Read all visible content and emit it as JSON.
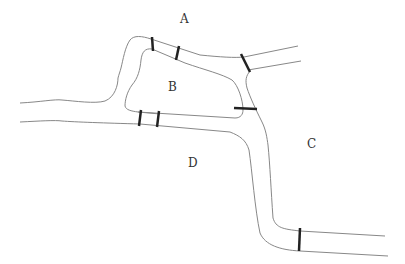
{
  "diagram": {
    "type": "bridges-map",
    "regions": [
      {
        "id": "A",
        "label": "A",
        "x": 183,
        "y": 23
      },
      {
        "id": "B",
        "label": "B",
        "x": 171,
        "y": 91
      },
      {
        "id": "C",
        "label": "C",
        "x": 310,
        "y": 146
      },
      {
        "id": "D",
        "label": "D",
        "x": 191,
        "y": 167
      }
    ],
    "bridges_count": 7,
    "colors": {
      "river": "#888888",
      "bridge": "#222222",
      "text": "#333333"
    }
  }
}
